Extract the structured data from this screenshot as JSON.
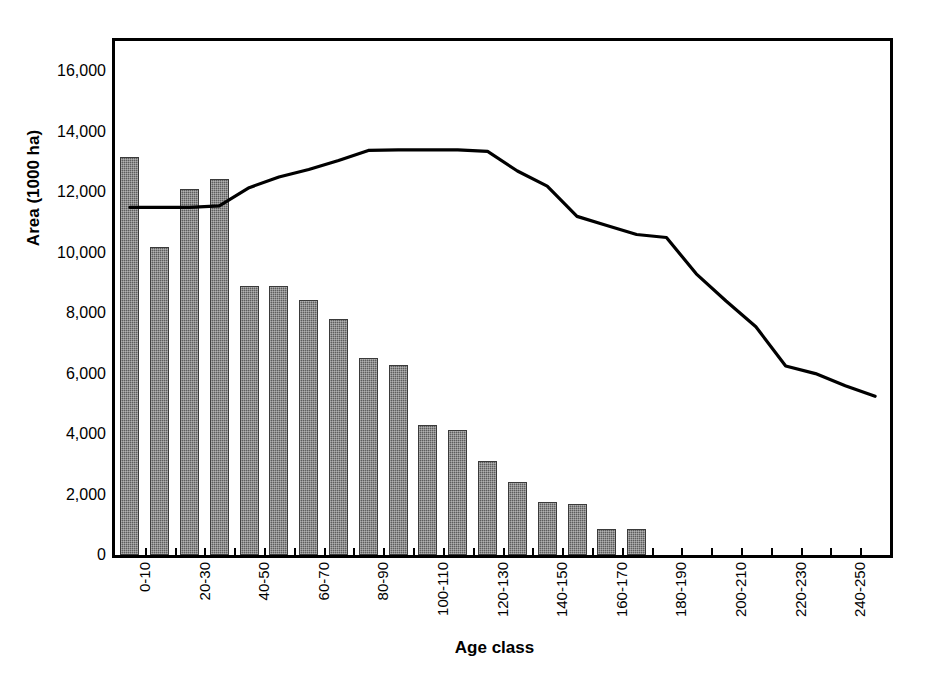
{
  "chart_data": {
    "type": "bar",
    "title": "",
    "subtitle": "",
    "xlabel": "Age class",
    "ylabel": "Area (1000 ha)",
    "ylim": [
      0,
      17000
    ],
    "yticks": [
      0,
      2000,
      4000,
      6000,
      8000,
      10000,
      12000,
      14000,
      16000
    ],
    "ytick_labels": [
      "0",
      "2,000",
      "4,000",
      "6,000",
      "8,000",
      "10,000",
      "12,000",
      "14,000",
      "16,000"
    ],
    "grid": false,
    "legend": "none",
    "categories": [
      "0-10",
      "10-20",
      "20-30",
      "30-40",
      "40-50",
      "50-60",
      "60-70",
      "70-80",
      "80-90",
      "90-100",
      "100-110",
      "110-120",
      "120-130",
      "130-140",
      "140-150",
      "150-160",
      "160-170",
      "170-180",
      "180-190",
      "190-200",
      "200-210",
      "210-220",
      "220-230",
      "230-240",
      "240-250",
      "250-260"
    ],
    "xtick_labels_shown": [
      "0-10",
      "20-30",
      "40-50",
      "60-70",
      "80-90",
      "100-110",
      "120-130",
      "140-150",
      "160-170",
      "180-190",
      "200-210",
      "220-230",
      "240-250"
    ],
    "series": [
      {
        "name": "Area",
        "type": "bar",
        "color": "#5d5d5d",
        "values": [
          13150,
          10200,
          12100,
          12450,
          8900,
          8900,
          8450,
          7800,
          6500,
          6300,
          4300,
          4150,
          3100,
          2400,
          1750,
          1700,
          850,
          850,
          0,
          0,
          0,
          0,
          0,
          0,
          0,
          0
        ]
      },
      {
        "name": "Cumulative curve",
        "type": "line",
        "color": "#000000",
        "values": [
          11500,
          11500,
          11500,
          11550,
          12150,
          12500,
          12750,
          13050,
          13380,
          13400,
          13400,
          13400,
          13350,
          12700,
          12200,
          11200,
          10900,
          10600,
          10500,
          9300,
          8400,
          7550,
          6250,
          6000,
          5600,
          5250
        ]
      }
    ]
  }
}
